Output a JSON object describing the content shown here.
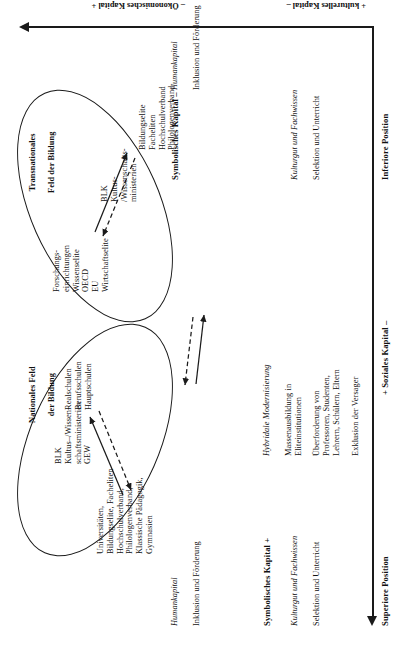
{
  "figure": {
    "type": "bourdieu-field-diagram",
    "axes": {
      "horizontal": {
        "name": "position-axis",
        "left_label": "Superiore Position",
        "center_label": "+ Soziales Kapital –",
        "right_label": "Inferiore Position"
      },
      "vertical": {
        "name": "capital-axis",
        "top_label": "– Ökonomisches Kapital +",
        "bottom_label": "+ kulturelles Kapital –"
      },
      "corner_labels": {
        "top_left": "Symbolisches Kapital +",
        "top_right": "Symbolisches Kapital –"
      }
    },
    "fields": [
      {
        "id": "national",
        "title_line1": "Nationales Feld",
        "title_line2": "der Bildung",
        "superior_group": "Universitäten,\nBildungselite, Facheliten\nHochschulverband,\nPhilologenverband,\nKlassische Pädagogik,\nGymnasien",
        "middle_group": "BLK\nKultus–/Wissen-\nschaftsministerien\nGEW",
        "inferior_group": "Realschulen\nBerufsschulen\nHauptschulen"
      },
      {
        "id": "transnational",
        "title_line1": "Transnationales",
        "title_line2": "Feld der Bildung",
        "superior_group": "Forschungs-\neinrichtungen\nWissenselite\nOECD\nEU\nWirtschaftselite",
        "middle_group": "BLK\nKultus-\n/Wissenschafts-\nministerien",
        "inferior_group": "Bildungselite\nFacheliten\nHochschulverband\nPhilologenverband"
      }
    ],
    "annotations": [
      {
        "id": "left-top",
        "heading": "Symbolisches Kapital +",
        "subheading": "Kulturgut und Fachwissen",
        "body": "Selektion und Unterricht"
      },
      {
        "id": "left-bottom",
        "subheading": "Humankapital",
        "body": "Inklusion und Förderung"
      },
      {
        "id": "center-top",
        "subheading": "Hybridale Modernisierung",
        "body1": "Massenausbildung in\nEliteinstitutionen",
        "body2": "Überforderung von\nProfessoren, Studenten,\nLehrern, Schülern, Eltern",
        "body3": "Exklusion der Versager"
      },
      {
        "id": "right-top",
        "heading": "Symbolisches Kapital –",
        "subheading": "Kulturgut und Fachwissen",
        "body": "Selektion und Unterricht"
      },
      {
        "id": "right-bottom",
        "subheading": "Humankapital",
        "body": "Inklusion und Förderung"
      }
    ],
    "colors": {
      "ink": "#1a1a1a",
      "background": "#ffffff"
    }
  }
}
